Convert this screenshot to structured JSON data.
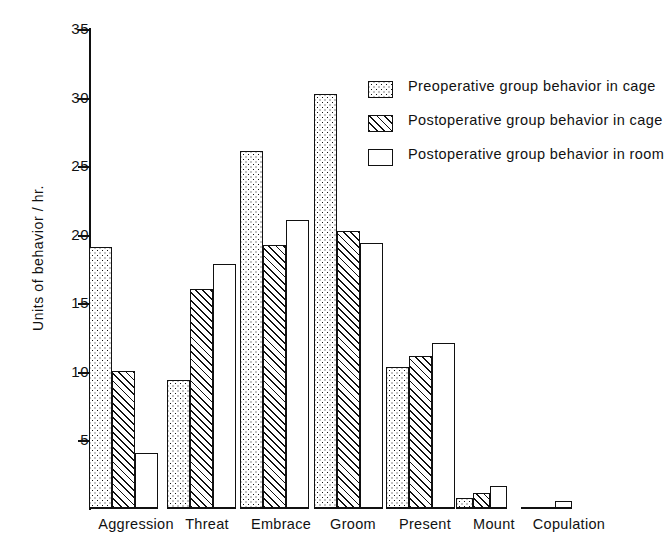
{
  "chart_data": {
    "type": "bar",
    "title": "",
    "xlabel": "",
    "ylabel": "Units of behavior / hr.",
    "categories": [
      "Aggression",
      "Threat",
      "Embrace",
      "Groom",
      "Present",
      "Mount",
      "Copulation"
    ],
    "ylim": [
      0,
      35
    ],
    "yticks": [
      5,
      10,
      15,
      20,
      25,
      30,
      35
    ],
    "grid": false,
    "legend_position": "upper-right",
    "series": [
      {
        "name": "Preoperative group behavior in cage",
        "pattern": "checkered",
        "values": [
          19.0,
          9.3,
          26.0,
          30.2,
          10.3,
          0.7,
          0.0
        ]
      },
      {
        "name": "Postoperative group behavior in cage",
        "pattern": "diagonal-hatch",
        "values": [
          10.0,
          16.0,
          19.2,
          20.2,
          11.1,
          1.1,
          0.0
        ]
      },
      {
        "name": "Postoperative group behavior in room",
        "pattern": "empty",
        "values": [
          4.0,
          17.8,
          21.0,
          19.3,
          12.0,
          1.6,
          0.5
        ]
      }
    ]
  },
  "axis": {
    "y_title": "Units of behavior / hr.",
    "tick_labels": [
      "35",
      "30",
      "25",
      "20",
      "15",
      "10",
      "5"
    ]
  },
  "legend": {
    "items": [
      {
        "label": "Preoperative group behavior in cage",
        "swatch": "checkered-swatch"
      },
      {
        "label": "Postoperative group behavior in cage",
        "swatch": "hatch-swatch"
      },
      {
        "label": "Postoperative group behavior in room",
        "swatch": "empty-swatch"
      }
    ]
  }
}
